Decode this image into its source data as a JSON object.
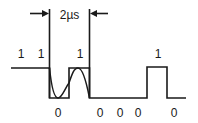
{
  "diagram": {
    "timing_label": "2µs",
    "bits_top": [
      {
        "label": "1",
        "x": 21
      },
      {
        "label": "1",
        "x": 41
      },
      {
        "label": "1",
        "x": 80
      },
      {
        "label": "1",
        "x": 158
      }
    ],
    "bits_bottom": [
      {
        "label": "0",
        "x": 58
      },
      {
        "label": "0",
        "x": 100
      },
      {
        "label": "0",
        "x": 120
      },
      {
        "label": "0",
        "x": 138
      },
      {
        "label": "0",
        "x": 174
      }
    ],
    "colors": {
      "line": "#1a1a1a",
      "background": "#ffffff"
    }
  }
}
